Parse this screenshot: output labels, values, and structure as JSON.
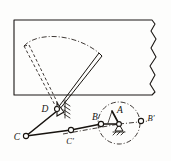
{
  "figure": {
    "background_color": "#fdfdfc",
    "ink_color": "#17130f"
  },
  "labels": {
    "pivot_d": "D",
    "joint_c": "C",
    "joint_c_prime": "C'",
    "joint_b": "B",
    "crank_center_a": "A",
    "joint_b_prime": "B'"
  },
  "elements": {
    "windshield_panel": "windshield-panel-torn-right-edge",
    "wiper_blade_solid": "wiper-blade-current-position",
    "wiper_blade_dashed": "wiper-blade-swept-position",
    "sweep_arc": "wiper-sweep-arc-dash-dot",
    "fixed_pivot_d": "fixed-pivot-with-ground-hatching",
    "crank_circle": "crank-path-circle-dash-dot",
    "crank_ground": "crank-ground-hatching",
    "centerline_horizontal": "crank-axis-centerline"
  },
  "geometry": {
    "panel": {
      "left": 14,
      "top": 20,
      "right": 158,
      "bottom": 95
    },
    "pivot_d": {
      "x": 57,
      "y": 109
    },
    "joint_c": {
      "x": 26,
      "y": 136
    },
    "joint_c_prime": {
      "x": 71,
      "y": 130
    },
    "joint_b": {
      "x": 101,
      "y": 124
    },
    "crank_center_a": {
      "x": 119,
      "y": 124
    },
    "joint_b_prime": {
      "x": 141,
      "y": 121
    },
    "crank_circle_radius": 21,
    "blade_tip_solid": {
      "x": 99,
      "y": 53
    },
    "blade_tip_dashed": {
      "x": 24,
      "y": 46
    }
  }
}
